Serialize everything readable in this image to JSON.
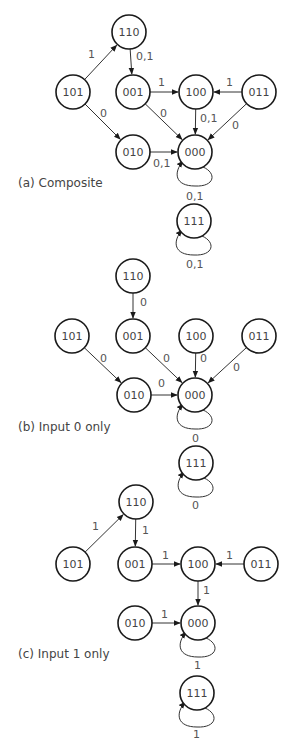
{
  "panels": [
    {
      "id": "a",
      "caption": "(a) Composite",
      "caption_pos": [
        18,
        187
      ],
      "nodes": [
        {
          "id": "110",
          "x": 129,
          "y": 32
        },
        {
          "id": "101",
          "x": 73,
          "y": 92
        },
        {
          "id": "001",
          "x": 133,
          "y": 92
        },
        {
          "id": "100",
          "x": 196,
          "y": 92
        },
        {
          "id": "011",
          "x": 259,
          "y": 92
        },
        {
          "id": "010",
          "x": 133,
          "y": 152
        },
        {
          "id": "000",
          "x": 195,
          "y": 152
        },
        {
          "id": "111",
          "x": 194,
          "y": 221
        }
      ],
      "edges": [
        {
          "from": "101",
          "to": "110",
          "label": "1",
          "lx": 88,
          "ly": 58
        },
        {
          "from": "110",
          "to": "001",
          "label": "0,1",
          "lx": 136,
          "ly": 60
        },
        {
          "from": "101",
          "to": "010",
          "label": "0",
          "lx": 100,
          "ly": 117
        },
        {
          "from": "001",
          "to": "100",
          "label": "1",
          "lx": 158,
          "ly": 86
        },
        {
          "from": "011",
          "to": "100",
          "label": "1",
          "lx": 226,
          "ly": 86
        },
        {
          "from": "001",
          "to": "000",
          "label": "0",
          "lx": 160,
          "ly": 117
        },
        {
          "from": "100",
          "to": "000",
          "label": "0,1",
          "lx": 200,
          "ly": 122
        },
        {
          "from": "011",
          "to": "000",
          "label": "0",
          "lx": 232,
          "ly": 129
        },
        {
          "from": "010",
          "to": "000",
          "label": "0,1",
          "lx": 153,
          "ly": 167
        }
      ],
      "loops": [
        {
          "node": "000",
          "label": "0,1",
          "lx": 186,
          "ly": 200
        },
        {
          "node": "111",
          "label": "0,1",
          "lx": 186,
          "ly": 268
        }
      ]
    },
    {
      "id": "b",
      "caption": "(b) Input 0 only",
      "caption_pos": [
        18,
        431
      ],
      "nodes": [
        {
          "id": "110",
          "x": 133,
          "y": 276
        },
        {
          "id": "101",
          "x": 72,
          "y": 336
        },
        {
          "id": "001",
          "x": 133,
          "y": 336
        },
        {
          "id": "100",
          "x": 196,
          "y": 336
        },
        {
          "id": "011",
          "x": 259,
          "y": 336
        },
        {
          "id": "010",
          "x": 134,
          "y": 395
        },
        {
          "id": "000",
          "x": 195,
          "y": 395
        },
        {
          "id": "111",
          "x": 196,
          "y": 463
        }
      ],
      "edges": [
        {
          "from": "110",
          "to": "001",
          "label": "0",
          "lx": 140,
          "ly": 306
        },
        {
          "from": "101",
          "to": "010",
          "label": "0",
          "lx": 100,
          "ly": 362
        },
        {
          "from": "001",
          "to": "000",
          "label": "0",
          "lx": 163,
          "ly": 362
        },
        {
          "from": "100",
          "to": "000",
          "label": "0",
          "lx": 200,
          "ly": 362
        },
        {
          "from": "011",
          "to": "000",
          "label": "0",
          "lx": 233,
          "ly": 371
        },
        {
          "from": "010",
          "to": "000",
          "label": "0",
          "lx": 158,
          "ly": 387
        }
      ],
      "loops": [
        {
          "node": "000",
          "label": "0",
          "lx": 192,
          "ly": 442
        },
        {
          "node": "111",
          "label": "0",
          "lx": 192,
          "ly": 509
        }
      ]
    },
    {
      "id": "c",
      "caption": "(c) Input 1 only",
      "caption_pos": [
        18,
        658
      ],
      "nodes": [
        {
          "id": "110",
          "x": 136,
          "y": 502
        },
        {
          "id": "101",
          "x": 73,
          "y": 564
        },
        {
          "id": "001",
          "x": 135,
          "y": 564
        },
        {
          "id": "100",
          "x": 198,
          "y": 564
        },
        {
          "id": "011",
          "x": 261,
          "y": 564
        },
        {
          "id": "010",
          "x": 135,
          "y": 623
        },
        {
          "id": "000",
          "x": 198,
          "y": 623
        },
        {
          "id": "111",
          "x": 197,
          "y": 693
        }
      ],
      "edges": [
        {
          "from": "101",
          "to": "110",
          "label": "1",
          "lx": 92,
          "ly": 530
        },
        {
          "from": "110",
          "to": "001",
          "label": "1",
          "lx": 142,
          "ly": 534
        },
        {
          "from": "001",
          "to": "100",
          "label": "1",
          "lx": 162,
          "ly": 559
        },
        {
          "from": "011",
          "to": "100",
          "label": "1",
          "lx": 226,
          "ly": 559
        },
        {
          "from": "100",
          "to": "000",
          "label": "1",
          "lx": 203,
          "ly": 594
        },
        {
          "from": "010",
          "to": "000",
          "label": "1",
          "lx": 161,
          "ly": 618
        }
      ],
      "loops": [
        {
          "node": "000",
          "label": "1",
          "lx": 194,
          "ly": 669
        },
        {
          "node": "111",
          "label": "1",
          "lx": 193,
          "ly": 738
        }
      ]
    }
  ],
  "style": {
    "node_radius": 17,
    "stroke": "#1a1a1a",
    "label_color": "#555555"
  }
}
